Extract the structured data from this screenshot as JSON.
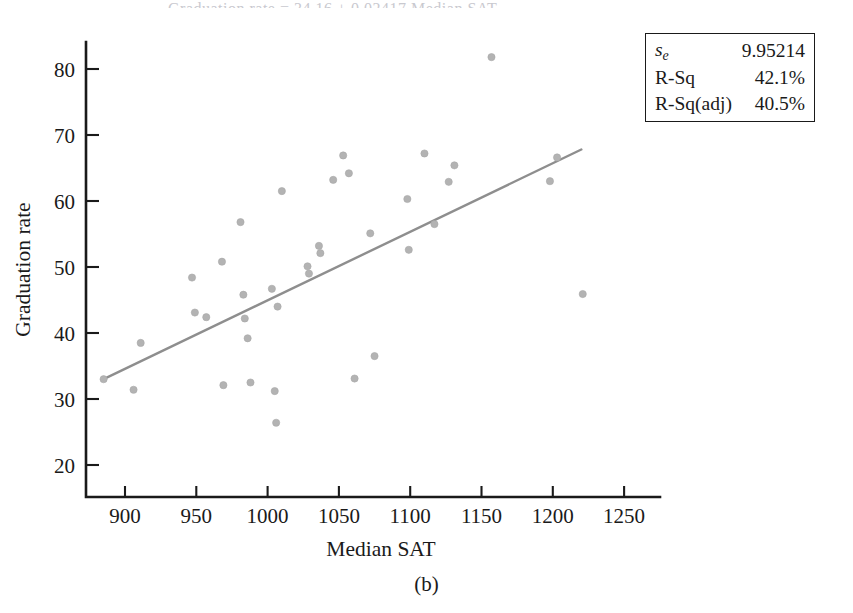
{
  "figure": {
    "caption": "(b)",
    "clipped_header": "Graduation rate = 34.16 + 0.02417 Median SAT"
  },
  "stats_box": {
    "rows": [
      {
        "key_main": "s",
        "key_sub": "e",
        "value": "9.95214"
      },
      {
        "key_main": "R-Sq",
        "key_sub": "",
        "value": "42.1%"
      },
      {
        "key_main": "R-Sq(adj)",
        "key_sub": "",
        "value": "40.5%"
      }
    ]
  },
  "chart_data": {
    "type": "scatter",
    "title": "",
    "xlabel": "Median SAT",
    "ylabel": "Graduation rate",
    "xlim": [
      863,
      1270
    ],
    "ylim": [
      14.5,
      85
    ],
    "xticks": [
      900,
      950,
      1000,
      1050,
      1100,
      1150,
      1200,
      1250
    ],
    "yticks": [
      20,
      30,
      40,
      50,
      60,
      70,
      80
    ],
    "grid": false,
    "legend": "none",
    "marker_color": "#b3b3b3",
    "line_color": "#8e8e8e",
    "points": [
      {
        "x": 885,
        "y": 33.0
      },
      {
        "x": 906,
        "y": 31.4
      },
      {
        "x": 911,
        "y": 38.5
      },
      {
        "x": 947,
        "y": 48.4
      },
      {
        "x": 949,
        "y": 43.1
      },
      {
        "x": 957,
        "y": 42.4
      },
      {
        "x": 968,
        "y": 50.8
      },
      {
        "x": 969,
        "y": 32.1
      },
      {
        "x": 981,
        "y": 56.8
      },
      {
        "x": 983,
        "y": 45.8
      },
      {
        "x": 984,
        "y": 42.2
      },
      {
        "x": 986,
        "y": 39.2
      },
      {
        "x": 988,
        "y": 32.5
      },
      {
        "x": 1003,
        "y": 46.7
      },
      {
        "x": 1005,
        "y": 31.2
      },
      {
        "x": 1006,
        "y": 26.4
      },
      {
        "x": 1007,
        "y": 44.0
      },
      {
        "x": 1010,
        "y": 61.5
      },
      {
        "x": 1028,
        "y": 50.1
      },
      {
        "x": 1029,
        "y": 49.0
      },
      {
        "x": 1036,
        "y": 53.2
      },
      {
        "x": 1037,
        "y": 52.1
      },
      {
        "x": 1046,
        "y": 63.2
      },
      {
        "x": 1053,
        "y": 66.9
      },
      {
        "x": 1057,
        "y": 64.2
      },
      {
        "x": 1061,
        "y": 33.1
      },
      {
        "x": 1072,
        "y": 55.1
      },
      {
        "x": 1075,
        "y": 36.5
      },
      {
        "x": 1098,
        "y": 60.3
      },
      {
        "x": 1099,
        "y": 52.6
      },
      {
        "x": 1110,
        "y": 67.2
      },
      {
        "x": 1117,
        "y": 56.5
      },
      {
        "x": 1127,
        "y": 62.9
      },
      {
        "x": 1131,
        "y": 65.4
      },
      {
        "x": 1157,
        "y": 81.8
      },
      {
        "x": 1198,
        "y": 63.0
      },
      {
        "x": 1203,
        "y": 66.6
      },
      {
        "x": 1221,
        "y": 45.9
      }
    ],
    "fit_line": {
      "x_start": 885,
      "y_start": 33.0,
      "x_end": 1220,
      "y_end": 67.8
    }
  }
}
